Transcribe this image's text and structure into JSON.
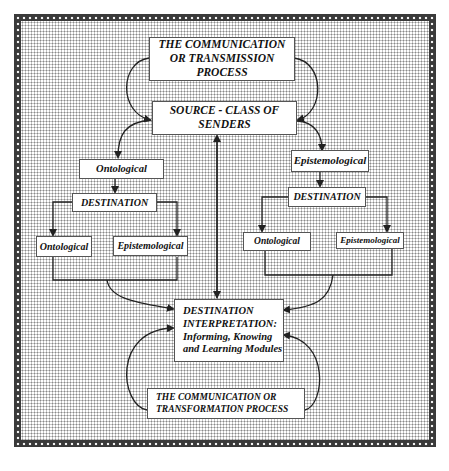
{
  "diagram": {
    "top_process": {
      "lines": [
        "THE COMMUNICATION",
        "OR TRANSMISSION",
        "PROCESS"
      ]
    },
    "source": {
      "lines": [
        "SOURCE - CLASS OF",
        "SENDERS"
      ]
    },
    "left_branch": {
      "type_label": "Ontological",
      "destination_label": "DESTINATION",
      "children": [
        "Ontological",
        "Epistemological"
      ]
    },
    "right_branch": {
      "type_label": "Epistemological",
      "destination_label": "DESTINATION",
      "children": [
        "Ontological",
        "Epistemological"
      ]
    },
    "interpretation": {
      "lines": [
        "DESTINATION",
        "INTERPRETATION:",
        "Informing, Knowing",
        "and Learning Modules"
      ]
    },
    "bottom_process": {
      "lines": [
        "THE COMMUNICATION OR",
        "TRANSFORMATION PROCESS"
      ]
    }
  },
  "colors": {
    "line": "#222222",
    "box_fill": "#ffffff",
    "border_dark": "#3a3a3a"
  }
}
